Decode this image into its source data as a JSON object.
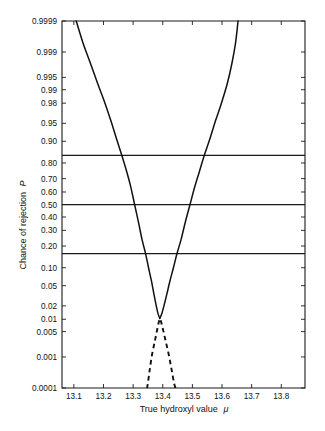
{
  "chart_data": {
    "type": "line",
    "title": "",
    "xlabel": "True hydroxyl value μ",
    "ylabel": "Chance of rejection P",
    "yscale": "probability",
    "grid": false,
    "legend": null,
    "xlim": [
      13.06,
      13.88
    ],
    "ylim": [
      0.0001,
      0.9999
    ],
    "xticks": [
      13.1,
      13.2,
      13.3,
      13.4,
      13.5,
      13.6,
      13.7,
      13.8
    ],
    "xtick_labels": [
      "13.1",
      "13.2",
      "13.3",
      "13.4",
      "13.5",
      "13.6",
      "13.7",
      "13.8"
    ],
    "yticks": [
      0.0001,
      0.001,
      0.005,
      0.01,
      0.02,
      0.05,
      0.1,
      0.2,
      0.3,
      0.4,
      0.5,
      0.6,
      0.7,
      0.8,
      0.9,
      0.95,
      0.98,
      0.99,
      0.995,
      0.999,
      0.9999
    ],
    "ytick_labels": [
      "0.0001",
      "0.001",
      "0.005",
      "0.01",
      "0.02",
      "0.05",
      "0.10",
      "0.20",
      "0.30",
      "0.40",
      "0.50",
      "0.60",
      "0.70",
      "0.80",
      "0.90",
      "0.95",
      "0.98",
      "0.99",
      "0.995",
      "0.999",
      "0.9999"
    ],
    "reference_lines": [
      {
        "name": "upper-reference-line",
        "y": 0.84,
        "style": "solid"
      },
      {
        "name": "median-reference-line",
        "y": 0.5,
        "style": "solid"
      },
      {
        "name": "lower-reference-line",
        "y": 0.16,
        "style": "solid"
      }
    ],
    "series": [
      {
        "name": "rejection-curve-left-solid",
        "style": "solid",
        "points": [
          [
            13.108,
            0.9999
          ],
          [
            13.13,
            0.9995
          ],
          [
            13.155,
            0.998
          ],
          [
            13.18,
            0.993
          ],
          [
            13.205,
            0.98
          ],
          [
            13.225,
            0.955
          ],
          [
            13.245,
            0.905
          ],
          [
            13.262,
            0.84
          ],
          [
            13.278,
            0.75
          ],
          [
            13.292,
            0.64
          ],
          [
            13.305,
            0.5
          ],
          [
            13.318,
            0.36
          ],
          [
            13.33,
            0.24
          ],
          [
            13.342,
            0.16
          ],
          [
            13.352,
            0.1
          ],
          [
            13.362,
            0.06
          ],
          [
            13.37,
            0.035
          ],
          [
            13.378,
            0.02
          ],
          [
            13.384,
            0.0135
          ],
          [
            13.39,
            0.0105
          ]
        ]
      },
      {
        "name": "rejection-curve-right-solid",
        "style": "solid",
        "points": [
          [
            13.39,
            0.0105
          ],
          [
            13.396,
            0.013
          ],
          [
            13.404,
            0.02
          ],
          [
            13.414,
            0.035
          ],
          [
            13.424,
            0.06
          ],
          [
            13.436,
            0.1
          ],
          [
            13.448,
            0.16
          ],
          [
            13.462,
            0.24
          ],
          [
            13.476,
            0.36
          ],
          [
            13.492,
            0.5
          ],
          [
            13.508,
            0.64
          ],
          [
            13.524,
            0.75
          ],
          [
            13.54,
            0.84
          ],
          [
            13.558,
            0.905
          ],
          [
            13.578,
            0.955
          ],
          [
            13.598,
            0.98
          ],
          [
            13.618,
            0.993
          ],
          [
            13.634,
            0.998
          ],
          [
            13.646,
            0.9995
          ],
          [
            13.654,
            0.9999
          ]
        ]
      },
      {
        "name": "rejection-curve-left-dashed",
        "style": "dashed",
        "points": [
          [
            13.388,
            0.0095
          ],
          [
            13.382,
            0.006
          ],
          [
            13.374,
            0.003
          ],
          [
            13.364,
            0.0012
          ],
          [
            13.356,
            0.0004
          ],
          [
            13.35,
            0.00015
          ],
          [
            13.347,
            0.0001
          ]
        ]
      },
      {
        "name": "rejection-curve-right-dashed",
        "style": "dashed",
        "points": [
          [
            13.393,
            0.0095
          ],
          [
            13.4,
            0.006
          ],
          [
            13.409,
            0.003
          ],
          [
            13.42,
            0.0012
          ],
          [
            13.43,
            0.0004
          ],
          [
            13.438,
            0.00015
          ],
          [
            13.443,
            0.0001
          ]
        ]
      }
    ]
  },
  "axes": {
    "x_title": "True hydroxyl value",
    "x_title_symbol": "μ",
    "y_title": "Chance of rejection",
    "y_title_symbol": "P"
  }
}
